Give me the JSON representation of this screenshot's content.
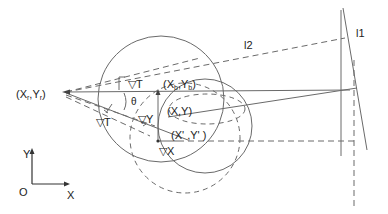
{
  "diagram": {
    "labels": {
      "origin_point": "(X",
      "origin_point_sub1": "r",
      "origin_point_mid": ",Y",
      "origin_point_sub2": "r",
      "origin_point_end": ")",
      "base_point": "(X",
      "base_point_sub1": "b",
      "base_point_mid": ",Y",
      "base_point_sub2": "b",
      "base_point_end": ")",
      "current_point": "(X,Y)",
      "new_point": "(X' ,Y' )",
      "delta_t_upper": "▽T",
      "delta_t_lower": "▽T",
      "delta_x": "▽X",
      "delta_y": "▽Y",
      "theta": "θ",
      "line_l1": "l1",
      "line_l2": "l2"
    },
    "axes": {
      "y_label": "Y",
      "x_label": "X",
      "origin_label": "O"
    },
    "colors": {
      "line": "#6a6a6a",
      "text": "#222222",
      "background": "#ffffff"
    }
  }
}
